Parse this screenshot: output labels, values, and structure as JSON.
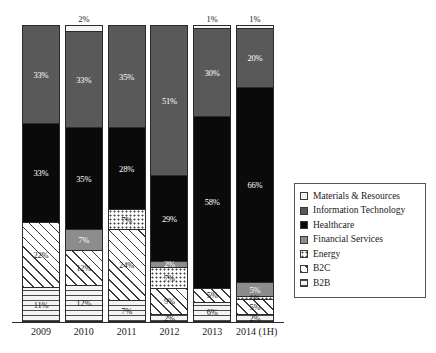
{
  "chart_data": {
    "type": "bar",
    "subtype": "stacked-100-percent",
    "title": "",
    "xlabel": "",
    "ylabel": "",
    "ylim": [
      0,
      100
    ],
    "grid": false,
    "legend_position": "right",
    "categories": [
      "2009",
      "2010",
      "2011",
      "2012",
      "2013",
      "2014 (1H)"
    ],
    "series": [
      {
        "name": "Materials & Resources",
        "color": "#f2f2f2",
        "pattern": "solid-light",
        "values": [
          0,
          2,
          0,
          0,
          1,
          1
        ],
        "labels": [
          "",
          "2%",
          "",
          "",
          "1%",
          "1%"
        ]
      },
      {
        "name": "Information Technology",
        "color": "#595959",
        "pattern": "solid-dark-gray",
        "values": [
          33,
          33,
          35,
          51,
          30,
          20
        ],
        "labels": [
          "33%",
          "33%",
          "35%",
          "51%",
          "30%",
          "20%"
        ]
      },
      {
        "name": "Healthcare",
        "color": "#0a0a0a",
        "pattern": "solid-black",
        "values": [
          33,
          35,
          28,
          29,
          58,
          66
        ],
        "labels": [
          "33%",
          "35%",
          "28%",
          "29%",
          "58%",
          "66%"
        ]
      },
      {
        "name": "Financial Services",
        "color": "#8c8c8c",
        "pattern": "solid-medium-gray",
        "values": [
          0,
          7,
          0,
          2,
          0,
          5
        ],
        "labels": [
          "",
          "7%",
          "",
          "2%",
          "",
          "5%"
        ]
      },
      {
        "name": "Energy",
        "color": "#fbfbfb",
        "pattern": "dotted",
        "values": [
          0,
          0,
          7,
          7,
          0,
          1
        ],
        "labels": [
          "",
          "",
          "7%",
          "7%",
          "",
          "1%"
        ]
      },
      {
        "name": "B2C",
        "color": "#ffffff",
        "pattern": "diagonal-hatch",
        "values": [
          22,
          12,
          24,
          9,
          5,
          5
        ],
        "labels": [
          "22%",
          "12%",
          "24%",
          "9%",
          "5%",
          "5%"
        ]
      },
      {
        "name": "B2B",
        "color": "#f4f4f4",
        "pattern": "horizontal-lines",
        "values": [
          11,
          12,
          7,
          2,
          6,
          2
        ],
        "labels": [
          "11%",
          "12%",
          "7%",
          "2%",
          "6%",
          "2%"
        ]
      }
    ]
  },
  "legend": {
    "items": [
      {
        "label": "Materials & Resources",
        "swatch": "materials"
      },
      {
        "label": "Information Technology",
        "swatch": "it"
      },
      {
        "label": "Healthcare",
        "swatch": "healthcare"
      },
      {
        "label": "Financial Services",
        "swatch": "financial"
      },
      {
        "label": "Energy",
        "swatch": "energy"
      },
      {
        "label": "B2C",
        "swatch": "b2c"
      },
      {
        "label": "B2B",
        "swatch": "b2b"
      }
    ]
  },
  "axis": {
    "ticks": [
      "2009",
      "2010",
      "2011",
      "2012",
      "2013",
      "2014 (1H)"
    ]
  }
}
